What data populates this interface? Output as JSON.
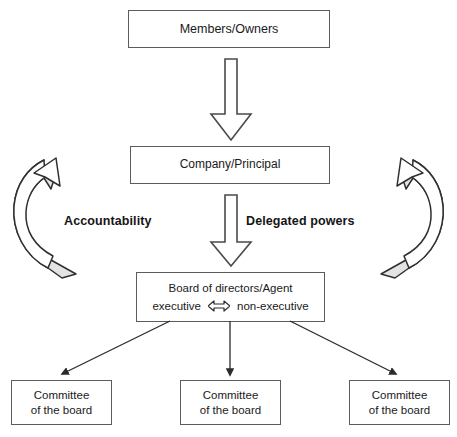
{
  "diagram": {
    "colors": {
      "stroke": "#3f3f3f",
      "box_border": "#5c5c5c",
      "curved_arrow_fill": "#e3e3e3",
      "text": "#1a1a1a",
      "background": "#ffffff"
    },
    "levels": {
      "members": {
        "label": "Members/Owners"
      },
      "company": {
        "label": "Company/Principal"
      },
      "board": {
        "title": "Board of directors/Agent",
        "left_role": "executive",
        "relation_icon": "bidirectional-arrow",
        "right_role": "non-executive"
      },
      "committees": [
        {
          "line1": "Committee",
          "line2": "of the board"
        },
        {
          "line1": "Committee",
          "line2": "of the board"
        },
        {
          "line1": "Committee",
          "line2": "of the board"
        }
      ]
    },
    "flows": {
      "accountability": {
        "label": "Accountability",
        "direction": "upward",
        "icon": "curved-arrow-up"
      },
      "delegated_powers": {
        "label": "Delegated powers",
        "direction": "downward",
        "icon": "curved-arrow-down"
      },
      "members_to_company": {
        "icon": "block-arrow-down"
      },
      "company_to_board": {
        "icon": "block-arrow-down"
      },
      "board_to_committees": {
        "icon": "thin-arrow-down",
        "count": 3
      }
    }
  }
}
